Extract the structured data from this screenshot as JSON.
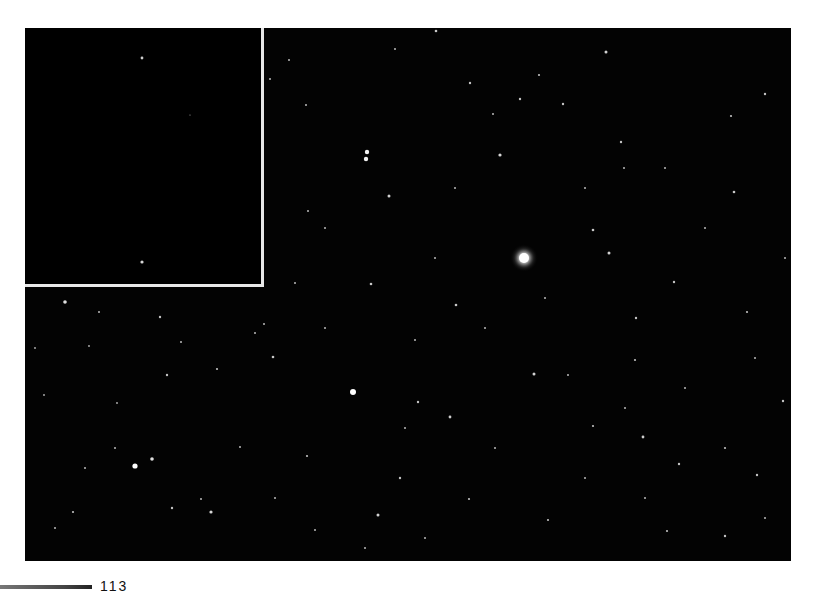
{
  "image": {
    "description": "Monochrome astronomical star field with a bright star right of center and an inset panel in the upper-left corner",
    "background_color": "#030303",
    "frame_color": "#ffffff",
    "inset_border_color": "#e8e8e8",
    "star_color": "#ffffff"
  },
  "inset": {
    "label": "",
    "stars": [
      {
        "x": 117,
        "y": 30,
        "r": 1.4
      },
      {
        "x": 117,
        "y": 234,
        "r": 1.6
      },
      {
        "x": 165,
        "y": 87,
        "r": 0.6
      }
    ]
  },
  "main_field": {
    "bright_star": {
      "x": 499,
      "y": 230,
      "r": 5,
      "halo": 14
    },
    "stars": [
      {
        "x": 342,
        "y": 124,
        "r": 2.2
      },
      {
        "x": 341,
        "y": 131,
        "r": 2.2
      },
      {
        "x": 475,
        "y": 127,
        "r": 1.6
      },
      {
        "x": 364,
        "y": 168,
        "r": 1.5
      },
      {
        "x": 328,
        "y": 364,
        "r": 3
      },
      {
        "x": 110,
        "y": 438,
        "r": 2.6
      },
      {
        "x": 127,
        "y": 431,
        "r": 1.8
      },
      {
        "x": 346,
        "y": 256,
        "r": 1.3
      },
      {
        "x": 431,
        "y": 277,
        "r": 1.3
      },
      {
        "x": 40,
        "y": 274,
        "r": 1.8
      },
      {
        "x": 74,
        "y": 284,
        "r": 1
      },
      {
        "x": 135,
        "y": 289,
        "r": 1.2
      },
      {
        "x": 192,
        "y": 341,
        "r": 1.1
      },
      {
        "x": 142,
        "y": 347,
        "r": 1.2
      },
      {
        "x": 248,
        "y": 329,
        "r": 1.3
      },
      {
        "x": 186,
        "y": 484,
        "r": 1.6
      },
      {
        "x": 147,
        "y": 480,
        "r": 1.2
      },
      {
        "x": 48,
        "y": 484,
        "r": 1.1
      },
      {
        "x": 353,
        "y": 487,
        "r": 1.5
      },
      {
        "x": 375,
        "y": 450,
        "r": 1.2
      },
      {
        "x": 425,
        "y": 389,
        "r": 1.4
      },
      {
        "x": 509,
        "y": 346,
        "r": 1.5
      },
      {
        "x": 393,
        "y": 374,
        "r": 1.2
      },
      {
        "x": 568,
        "y": 202,
        "r": 1.3
      },
      {
        "x": 584,
        "y": 225,
        "r": 1.5
      },
      {
        "x": 649,
        "y": 254,
        "r": 1.2
      },
      {
        "x": 596,
        "y": 114,
        "r": 1.2
      },
      {
        "x": 709,
        "y": 164,
        "r": 1.3
      },
      {
        "x": 780,
        "y": 53,
        "r": 1.2
      },
      {
        "x": 581,
        "y": 24,
        "r": 1.5
      },
      {
        "x": 740,
        "y": 66,
        "r": 1.2
      },
      {
        "x": 599,
        "y": 140,
        "r": 1
      },
      {
        "x": 706,
        "y": 88,
        "r": 1.1
      },
      {
        "x": 411,
        "y": 3,
        "r": 1.3
      },
      {
        "x": 495,
        "y": 71,
        "r": 1.2
      },
      {
        "x": 445,
        "y": 55,
        "r": 1.2
      },
      {
        "x": 514,
        "y": 47,
        "r": 1.1
      },
      {
        "x": 538,
        "y": 76,
        "r": 1.2
      },
      {
        "x": 468,
        "y": 86,
        "r": 1
      },
      {
        "x": 264,
        "y": 32,
        "r": 1
      },
      {
        "x": 370,
        "y": 21,
        "r": 1
      },
      {
        "x": 245,
        "y": 51,
        "r": 1
      },
      {
        "x": 281,
        "y": 77,
        "r": 1
      },
      {
        "x": 611,
        "y": 290,
        "r": 1.2
      },
      {
        "x": 610,
        "y": 332,
        "r": 1.1
      },
      {
        "x": 618,
        "y": 409,
        "r": 1.4
      },
      {
        "x": 654,
        "y": 436,
        "r": 1.2
      },
      {
        "x": 732,
        "y": 447,
        "r": 1.2
      },
      {
        "x": 700,
        "y": 420,
        "r": 1.1
      },
      {
        "x": 568,
        "y": 398,
        "r": 1.1
      },
      {
        "x": 543,
        "y": 347,
        "r": 1
      },
      {
        "x": 700,
        "y": 508,
        "r": 1.2
      },
      {
        "x": 642,
        "y": 503,
        "r": 1.1
      },
      {
        "x": 722,
        "y": 284,
        "r": 1.1
      },
      {
        "x": 758,
        "y": 373,
        "r": 1.2
      },
      {
        "x": 282,
        "y": 428,
        "r": 1.1
      },
      {
        "x": 239,
        "y": 296,
        "r": 1
      },
      {
        "x": 176,
        "y": 471,
        "r": 1
      },
      {
        "x": 290,
        "y": 502,
        "r": 1
      },
      {
        "x": 444,
        "y": 471,
        "r": 1.1
      },
      {
        "x": 523,
        "y": 492,
        "r": 1.1
      },
      {
        "x": 10,
        "y": 320,
        "r": 0.9
      },
      {
        "x": 19,
        "y": 367,
        "r": 0.9
      },
      {
        "x": 215,
        "y": 419,
        "r": 1
      },
      {
        "x": 230,
        "y": 305,
        "r": 1
      },
      {
        "x": 156,
        "y": 314,
        "r": 1
      },
      {
        "x": 92,
        "y": 375,
        "r": 0.9
      },
      {
        "x": 64,
        "y": 318,
        "r": 0.9
      },
      {
        "x": 300,
        "y": 300,
        "r": 1
      },
      {
        "x": 390,
        "y": 312,
        "r": 1
      },
      {
        "x": 460,
        "y": 300,
        "r": 1
      },
      {
        "x": 520,
        "y": 270,
        "r": 1
      },
      {
        "x": 660,
        "y": 360,
        "r": 1
      },
      {
        "x": 600,
        "y": 380,
        "r": 1
      },
      {
        "x": 730,
        "y": 330,
        "r": 1
      },
      {
        "x": 760,
        "y": 230,
        "r": 1
      },
      {
        "x": 680,
        "y": 200,
        "r": 1
      },
      {
        "x": 640,
        "y": 140,
        "r": 1
      },
      {
        "x": 560,
        "y": 160,
        "r": 1
      },
      {
        "x": 430,
        "y": 160,
        "r": 1
      },
      {
        "x": 300,
        "y": 200,
        "r": 1
      },
      {
        "x": 410,
        "y": 230,
        "r": 1
      },
      {
        "x": 283,
        "y": 183,
        "r": 1
      },
      {
        "x": 270,
        "y": 255,
        "r": 1
      },
      {
        "x": 380,
        "y": 400,
        "r": 1
      },
      {
        "x": 470,
        "y": 420,
        "r": 1
      },
      {
        "x": 560,
        "y": 450,
        "r": 1
      },
      {
        "x": 620,
        "y": 470,
        "r": 1
      },
      {
        "x": 740,
        "y": 490,
        "r": 1
      },
      {
        "x": 250,
        "y": 470,
        "r": 1
      },
      {
        "x": 90,
        "y": 420,
        "r": 1
      },
      {
        "x": 60,
        "y": 440,
        "r": 1
      },
      {
        "x": 30,
        "y": 500,
        "r": 1
      },
      {
        "x": 340,
        "y": 520,
        "r": 1
      },
      {
        "x": 400,
        "y": 510,
        "r": 1
      }
    ]
  },
  "scale": {
    "label": "113"
  }
}
